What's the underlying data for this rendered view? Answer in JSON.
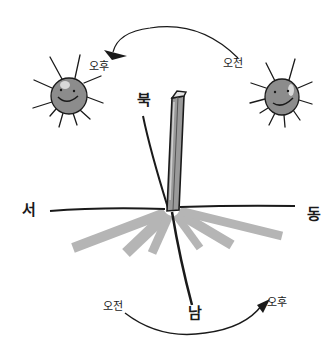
{
  "diagram": {
    "compass": {
      "north": "북",
      "south": "남",
      "west": "서",
      "east": "동"
    },
    "sun_path_top": {
      "start_label": "오전",
      "end_label": "오후"
    },
    "shadow_path_bottom": {
      "start_label": "오전",
      "end_label": "오후"
    },
    "suns": [
      {
        "name": "afternoon-sun",
        "label": "오후"
      },
      {
        "name": "morning-sun",
        "label": "오전"
      }
    ],
    "colors": {
      "ink": "#1a1a1a",
      "sun_fill": "#8c8c8c",
      "sun_highlight": "#d8d8d8",
      "stick_fill": "#9a9a9a",
      "shadow_ray": "#b5b5b5",
      "background": "#ffffff"
    }
  }
}
